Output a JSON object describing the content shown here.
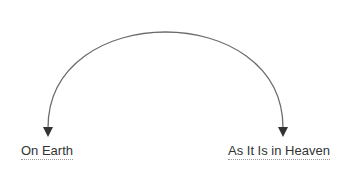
{
  "diagram": {
    "type": "arc-arrow",
    "from_label": "On Earth",
    "to_label": "As It Is in Heaven",
    "arrow_color": "#6b6b6b",
    "arrowhead_color": "#333333",
    "arrows": [
      "down-left-end",
      "down-right-end"
    ]
  }
}
